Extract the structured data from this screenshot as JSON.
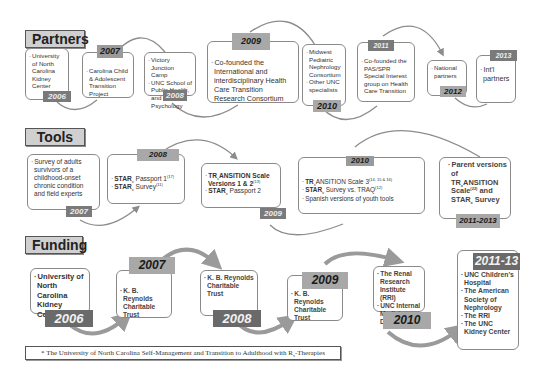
{
  "sections": {
    "partners": {
      "label": "Partners"
    },
    "tools": {
      "label": "Tools"
    },
    "funding": {
      "label": "Funding"
    }
  },
  "partners": [
    {
      "year": "2006",
      "items": [
        "University of North Carolina Kidney Center"
      ]
    },
    {
      "year": "2007",
      "items": [
        "Carolina Child & Adolescent Transition Project"
      ]
    },
    {
      "year": "2008",
      "items": [
        "Victory Junction Camp",
        "UNC School of Public Health, and Psychology"
      ]
    },
    {
      "year": "2009",
      "items": [
        "Co-founded the International and interdisciplinary Health Care Transition Research Consortium"
      ]
    },
    {
      "year": "2010",
      "items": [
        "Midwest Pediatric Nephrology Consortium",
        "Other UNC specialists"
      ]
    },
    {
      "year": "2011",
      "items": [
        "Co-founded the PAS/SPR Special Interest group on Health Care Transition"
      ]
    },
    {
      "year": "2012",
      "items": [
        "National partners"
      ]
    },
    {
      "year": "2013",
      "items": [
        "Int'l partners"
      ]
    }
  ],
  "tools": [
    {
      "year": "2007",
      "items": [
        "Survey of adults survivors of a childhood-onset chronic condition and field experts"
      ]
    },
    {
      "year": "2008",
      "items": [
        {
          "main": "STAR",
          "sub": "x",
          "rest": " Passport 1",
          "ref": "(17)"
        },
        {
          "main": "STAR",
          "sub": "x",
          "rest": " Survey",
          "ref": "(11)"
        }
      ]
    },
    {
      "year": "2009",
      "items": [
        {
          "main": "TR",
          "sub": "x",
          "rest": "ANSITION Scale Versions 1 & 2",
          "ref": "(13)"
        },
        {
          "main": "STAR",
          "sub": "x",
          "rest": " Passport 2",
          "ref": ""
        }
      ]
    },
    {
      "year": "2010",
      "items": [
        {
          "main": "TR",
          "sub": "x",
          "rest": "ANSITION Scale 3",
          "ref": "(14, 15 & 16)"
        },
        {
          "main": "STAR",
          "sub": "x",
          "rest": " Survey vs. TRAQ",
          "ref": "(12)"
        },
        {
          "main": "Spanish versions of youth tools",
          "sub": "",
          "rest": "",
          "ref": ""
        }
      ]
    },
    {
      "year": "2011-2013",
      "items": [
        "Parent versions of TRxANSITION Scale(22) and STARx Survey"
      ],
      "text_parts": {
        "a": "Parent versions of TR",
        "sub1": "x",
        "b": "ANSITION Scale",
        "ref": "(22)",
        "c": " and STAR",
        "sub2": "x",
        "d": " Survey"
      }
    }
  ],
  "funding": [
    {
      "year": "2006",
      "items": [
        "University of North Carolina Kidney Center"
      ]
    },
    {
      "year": "2007",
      "items": [
        "K. B. Reynolds Charitable Trust"
      ]
    },
    {
      "year": "2008",
      "items": [
        "K. B. Reynolds Charitable Trust"
      ]
    },
    {
      "year": "2009",
      "items": [
        "K. B. Reynolds Charitable Trust"
      ]
    },
    {
      "year": "2010",
      "items": [
        "The Renal Research Institute (RRI)",
        "UNC Internal Medisine Dept."
      ]
    },
    {
      "year": "2011-13",
      "items": [
        "UNC Children's Hospital",
        "The American Society of Nephrology",
        "The RRI",
        "The UNC Kidney Center"
      ]
    }
  ],
  "footnote": {
    "text": "* The University of North Carolina Self-Management and Transition to Adulthood with R",
    "sub": "x",
    "suffix": "-Therapies"
  },
  "colors": {
    "badge_dark": "#6a6a6a",
    "badge_mid": "#9a9a9a",
    "badge_light": "#a8a8a8",
    "border": "#8a8a8a",
    "arc": "#8c8c8c",
    "label_bg": "#d0d0d0"
  }
}
